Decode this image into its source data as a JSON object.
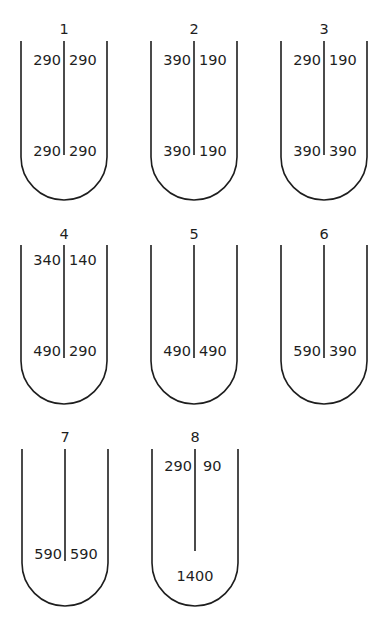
{
  "diagram": {
    "stroke_color": "#1e1e1e",
    "tubes": [
      {
        "label": "1",
        "top_left": "290",
        "top_right": "290",
        "bottom_left": "290",
        "bottom_right": "290",
        "bottom_center": null
      },
      {
        "label": "2",
        "top_left": "390",
        "top_right": "190",
        "bottom_left": "390",
        "bottom_right": "190",
        "bottom_center": null
      },
      {
        "label": "3",
        "top_left": "290",
        "top_right": "190",
        "bottom_left": "390",
        "bottom_right": "390",
        "bottom_center": null
      },
      {
        "label": "4",
        "top_left": "340",
        "top_right": "140",
        "bottom_left": "490",
        "bottom_right": "290",
        "bottom_center": null
      },
      {
        "label": "5",
        "top_left": null,
        "top_right": null,
        "bottom_left": "490",
        "bottom_right": "490",
        "bottom_center": null
      },
      {
        "label": "6",
        "top_left": null,
        "top_right": null,
        "bottom_left": "590",
        "bottom_right": "390",
        "bottom_center": null
      },
      {
        "label": "7",
        "top_left": null,
        "top_right": null,
        "bottom_left": "590",
        "bottom_right": "590",
        "bottom_center": null
      },
      {
        "label": "8",
        "top_left": "290",
        "top_right": "90",
        "bottom_left": null,
        "bottom_right": null,
        "bottom_center": "1400"
      }
    ]
  }
}
